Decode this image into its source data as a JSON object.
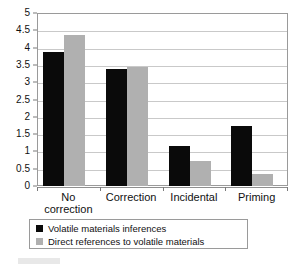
{
  "chart_data": {
    "type": "bar",
    "title": "",
    "xlabel": "",
    "ylabel": "",
    "ylim": [
      0,
      5
    ],
    "ytick_step": 0.5,
    "grid": true,
    "legend_position": "below-plot",
    "categories": [
      "No\ncorrection",
      "Correction",
      "Incidental",
      "Priming"
    ],
    "ytick_labels": [
      "0",
      "0.5",
      "1",
      "1.5",
      "2",
      "2.5",
      "3",
      "3.5",
      "4",
      "4.5",
      "5"
    ],
    "ytick_values": [
      0,
      0.5,
      1,
      1.5,
      2,
      2.5,
      3,
      3.5,
      4,
      4.5,
      5
    ],
    "series": [
      {
        "name": "Volatile materials inferences",
        "color": "#0a0a0a",
        "values": [
          3.87,
          3.38,
          1.16,
          1.73
        ]
      },
      {
        "name": "Direct references to volatile materials",
        "color": "#b0b0b0",
        "values": [
          4.36,
          3.44,
          0.72,
          0.35
        ]
      }
    ]
  },
  "legend": {
    "items": [
      {
        "label": "Volatile materials inferences",
        "swatch": "#0a0a0a"
      },
      {
        "label": "Direct references to volatile materials",
        "swatch": "#b0b0b0"
      }
    ]
  }
}
